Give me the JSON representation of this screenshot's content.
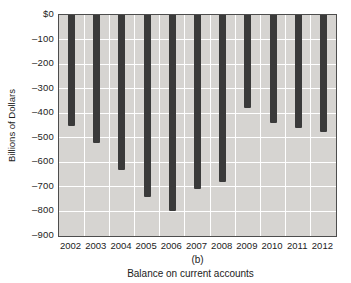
{
  "chart_data": {
    "type": "bar",
    "categories": [
      "2002",
      "2003",
      "2004",
      "2005",
      "2006",
      "2007",
      "2008",
      "2009",
      "2010",
      "2011",
      "2012"
    ],
    "values": [
      -450,
      -520,
      -630,
      -740,
      -800,
      -710,
      -680,
      -380,
      -440,
      -460,
      -475
    ],
    "title": "Balance on current accounts",
    "panel_label": "(b)",
    "xlabel": "",
    "ylabel": "Billions of Dollars",
    "ylim": [
      0,
      -900
    ],
    "ytick_labels": [
      "$0",
      "–100",
      "–200",
      "–300",
      "–400",
      "–500",
      "–600",
      "–700",
      "–800",
      "–900"
    ],
    "ytick_values": [
      0,
      -100,
      -200,
      -300,
      -400,
      -500,
      -600,
      -700,
      -800,
      -900
    ],
    "grid": "on",
    "legend": "none"
  },
  "colors": {
    "bar": "#3a3a3a",
    "plot_bg": "#d6d4d1",
    "gridline": "#ffffff",
    "frame": "#4d4d4d",
    "text": "#1c1c1c",
    "page_bg": "#ffffff"
  }
}
